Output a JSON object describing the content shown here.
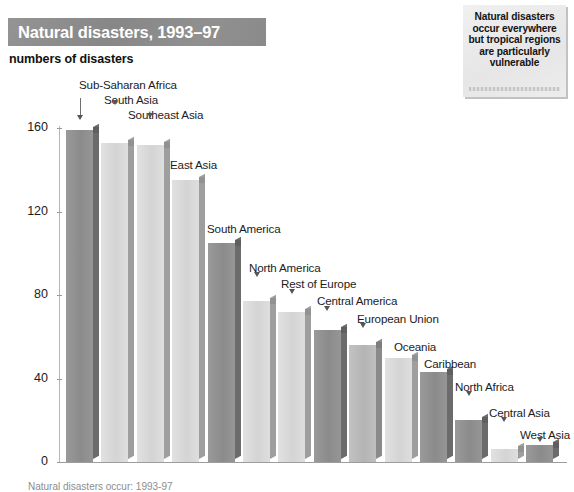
{
  "title": {
    "banner_text": "Natural disasters, 1993–97",
    "subtitle": "numbers of disasters"
  },
  "note": {
    "text": "Natural disasters occur everywhere but tropical regions are particularly vulnerable"
  },
  "footer": {
    "caption": "Natural disasters occur: 1993-97"
  },
  "colors": {
    "banner_bg": "#8e8e8e",
    "banner_text": "#ffffff",
    "note_bg": "#ececec",
    "axis": "#9c9c9c",
    "bar_dark": "#8a8a8a",
    "bar_light": "#d9d9d9",
    "bar_side": "#6e6e6e"
  },
  "chart_data": {
    "type": "bar",
    "title": "Natural disasters, 1993–97",
    "xlabel": "",
    "ylabel": "numbers of disasters",
    "ylim": [
      0,
      160
    ],
    "yticks": [
      0,
      40,
      80,
      120,
      160
    ],
    "grid": false,
    "legend": "none",
    "categories": [
      "Sub-Saharan Africa",
      "South Asia",
      "Southeast Asia",
      "East Asia",
      "South America",
      "North America",
      "Rest of Europe",
      "Central America",
      "European Union",
      "Oceania",
      "Caribbean",
      "North Africa",
      "Central Asia",
      "West Asia"
    ],
    "values": [
      159,
      153,
      152,
      135,
      105,
      77,
      72,
      63,
      56,
      50,
      43,
      20,
      6,
      8
    ],
    "bars": [
      {
        "label": "Sub-Saharan Africa",
        "value": 159,
        "shade": "dark"
      },
      {
        "label": "South Asia",
        "value": 153,
        "shade": "light"
      },
      {
        "label": "Southeast Asia",
        "value": 152,
        "shade": "light"
      },
      {
        "label": "East Asia",
        "value": 135,
        "shade": "light"
      },
      {
        "label": "South America",
        "value": 105,
        "shade": "dark"
      },
      {
        "label": "North America",
        "value": 77,
        "shade": "light"
      },
      {
        "label": "Rest of Europe",
        "value": 72,
        "shade": "light"
      },
      {
        "label": "Central America",
        "value": 63,
        "shade": "dark"
      },
      {
        "label": "European Union",
        "value": 56,
        "shade": "mid"
      },
      {
        "label": "Oceania",
        "value": 50,
        "shade": "light"
      },
      {
        "label": "Caribbean",
        "value": 43,
        "shade": "dark"
      },
      {
        "label": "North Africa",
        "value": 20,
        "shade": "dark"
      },
      {
        "label": "Central Asia",
        "value": 6,
        "shade": "light"
      },
      {
        "label": "West Asia",
        "value": 8,
        "shade": "dark"
      }
    ]
  }
}
